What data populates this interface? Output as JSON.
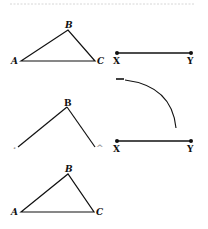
{
  "figure": {
    "header_rule_color": "#cccccc",
    "stroke_color": "#111111",
    "triangle_top": {
      "labels": {
        "A": "A",
        "B": "B",
        "C": "C"
      },
      "points": {
        "A": [
          21,
          61
        ],
        "B": [
          68,
          30
        ],
        "C": [
          95,
          61
        ]
      }
    },
    "segment_top": {
      "labels": {
        "X": "X",
        "Y": "Y"
      },
      "points": {
        "X": [
          117,
          53
        ],
        "Y": [
          191,
          53
        ]
      }
    },
    "construction_arc": {
      "start": [
        117,
        79
      ],
      "end": [
        176,
        128
      ]
    },
    "open_angle": {
      "labels": {
        "A": ".",
        "B": "B",
        "C": "^"
      },
      "points": {
        "A": [
          18,
          147
        ],
        "B": [
          67,
          107
        ],
        "C": [
          95,
          147
        ]
      }
    },
    "segment_middle": {
      "labels": {
        "X": "X",
        "Y": "Y"
      },
      "points": {
        "X": [
          117,
          141
        ],
        "Y": [
          191,
          141
        ]
      }
    },
    "triangle_bottom": {
      "labels": {
        "A": "A",
        "B": "B",
        "C": "C"
      },
      "points": {
        "A": [
          21,
          212
        ],
        "B": [
          68,
          174
        ],
        "C": [
          94,
          212
        ]
      }
    }
  }
}
